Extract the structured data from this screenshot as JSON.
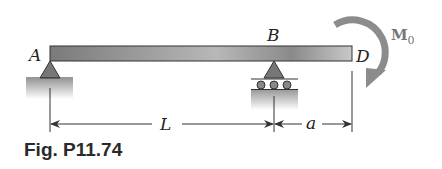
{
  "figure": {
    "caption": "Fig. P11.74",
    "labels": {
      "A": "A",
      "B": "B",
      "D": "D",
      "moment": "M",
      "moment_sub": "0"
    },
    "dimensions": {
      "span_AB": "L",
      "overhang_BD": "a"
    },
    "supports": {
      "A": "pin",
      "B": "roller"
    },
    "load": {
      "type": "couple",
      "at": "D",
      "direction": "clockwise",
      "symbol": "M0"
    },
    "colors": {
      "beam": "#8a8a8a",
      "moment_arrow": "#8c8c8c",
      "ground": "#a0a0a0",
      "line": "#333333"
    }
  }
}
